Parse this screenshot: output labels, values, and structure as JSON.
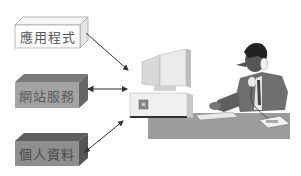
{
  "diagram": {
    "sources": [
      {
        "id": "applications",
        "label": "應用程式",
        "style": "white"
      },
      {
        "id": "web-services",
        "label": "網站服務",
        "style": "gray"
      },
      {
        "id": "personal-data",
        "label": "個人資料",
        "style": "dark-gray"
      }
    ],
    "target": {
      "id": "computer-user",
      "icon": "person-at-computer-on-phone"
    },
    "arrows": [
      {
        "from": "applications",
        "to": "computer-user",
        "direction": "one-way"
      },
      {
        "from": "web-services",
        "to": "computer-user",
        "direction": "two-way"
      },
      {
        "from": "personal-data",
        "to": "computer-user",
        "direction": "two-way"
      }
    ]
  },
  "colors": {
    "white_box": "#ffffff",
    "gray_box_front": "#a0a0a0",
    "gray_box_top": "#7a7a7a",
    "gray_box_side": "#6a6a6a",
    "dark_box_front": "#8c8c8c",
    "dark_box_top": "#5e5e5e",
    "dark_box_side": "#555555",
    "desk": "#9a9a9a",
    "arrow": "#333333"
  }
}
